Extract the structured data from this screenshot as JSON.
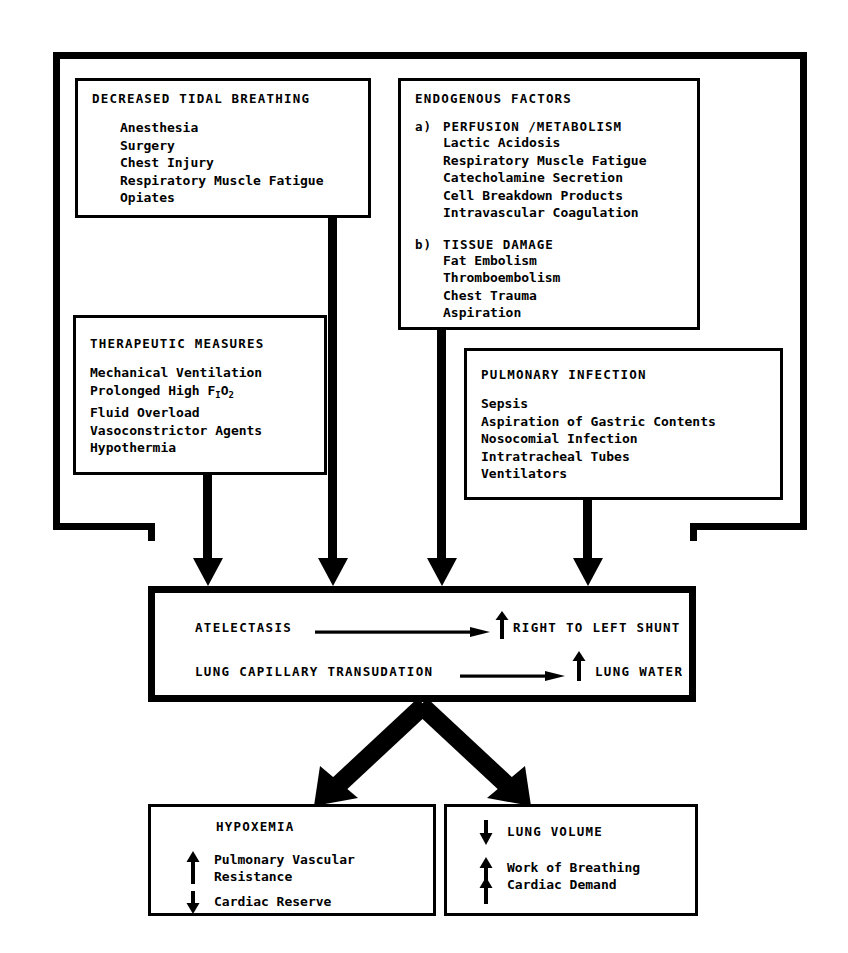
{
  "diagram": {
    "boxes": {
      "decreased_tidal_breathing": {
        "heading": "DECREASED TIDAL BREATHING",
        "items": [
          "Anesthesia",
          "Surgery",
          "Chest Injury",
          "Respiratory Muscle Fatigue",
          "Opiates"
        ]
      },
      "endogenous_factors": {
        "heading": "ENDOGENOUS FACTORS",
        "groups": [
          {
            "marker": "a)",
            "subheading": "PERFUSION /METABOLISM",
            "items": [
              "Lactic Acidosis",
              "Respiratory Muscle Fatigue",
              "Catecholamine Secretion",
              "Cell Breakdown Products",
              "Intravascular Coagulation"
            ]
          },
          {
            "marker": "b)",
            "subheading": "TISSUE DAMAGE",
            "items": [
              "Fat Embolism",
              "Thromboembolism",
              "Chest Trauma",
              "Aspiration"
            ]
          }
        ]
      },
      "therapeutic_measures": {
        "heading": "THERAPEUTIC MEASURES",
        "items": [
          "Mechanical Ventilation",
          "Prolonged High F",
          "Fluid Overload",
          "Vasoconstrictor Agents",
          "Hypothermia"
        ],
        "fio2": {
          "base": "F",
          "sub1": "I",
          "mid": "O",
          "sub2": "2"
        }
      },
      "pulmonary_infection": {
        "heading": "PULMONARY INFECTION",
        "items": [
          "Sepsis",
          "Aspiration of Gastric Contents",
          "Nosocomial Infection",
          "Intratracheal Tubes",
          "Ventilators"
        ]
      },
      "central": {
        "rows": [
          {
            "cause": "ATELECTASIS",
            "arrow": "long-right-arrow",
            "change": "up",
            "effect": "RIGHT TO LEFT SHUNT"
          },
          {
            "cause": "LUNG CAPILLARY TRANSUDATION",
            "arrow": "long-right-arrow",
            "change": "up",
            "effect": "LUNG WATER"
          }
        ]
      },
      "hypoxemia": {
        "heading": "HYPOXEMIA",
        "entries": [
          {
            "change": "up",
            "lines": [
              "Pulmonary Vascular",
              "Resistance"
            ]
          },
          {
            "change": "down",
            "lines": [
              "Cardiac Reserve"
            ]
          }
        ]
      },
      "lung_volume": {
        "heading": "LUNG VOLUME",
        "heading_change": "down",
        "entries": [
          {
            "change": "up",
            "lines": [
              "Work of Breathing"
            ]
          },
          {
            "change": "up",
            "lines": [
              "Cardiac Demand"
            ]
          }
        ]
      }
    },
    "colors": {
      "ink": "#000000",
      "paper": "#ffffff"
    }
  }
}
